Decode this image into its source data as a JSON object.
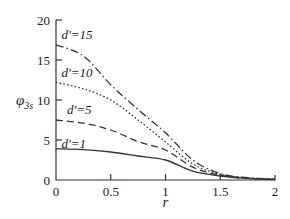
{
  "chart_data": {
    "type": "line",
    "title": "",
    "xlabel": "r",
    "ylabel": "φ3s",
    "ylabel_main": "φ",
    "ylabel_sub": "3s",
    "xlim": [
      0,
      2
    ],
    "ylim": [
      0,
      20
    ],
    "xticks": [
      0,
      0.5,
      1,
      1.5,
      2
    ],
    "xtick_labels": [
      "0",
      "0.5",
      "1",
      "1.5",
      "2"
    ],
    "yticks": [
      0,
      5,
      10,
      15,
      20
    ],
    "ytick_labels": [
      "0",
      "5",
      "10",
      "15",
      "20"
    ],
    "grid": false,
    "legend": "inline labels",
    "series": [
      {
        "name": "d'=15",
        "style": "dash-dot",
        "x": [
          0,
          0.25,
          0.5,
          0.75,
          1.0,
          1.25,
          1.5,
          1.75,
          2.0
        ],
        "values": [
          16.9,
          15.5,
          11.9,
          8.8,
          5.9,
          2.5,
          0.8,
          0.3,
          0.1
        ]
      },
      {
        "name": "d'=10",
        "style": "dotted",
        "x": [
          0,
          0.25,
          0.5,
          0.75,
          1.0,
          1.25,
          1.5,
          1.75,
          2.0
        ],
        "values": [
          12.2,
          11.4,
          10.0,
          7.5,
          4.75,
          2.0,
          0.7,
          0.25,
          0.1
        ]
      },
      {
        "name": "d'=5",
        "style": "dashed",
        "x": [
          0,
          0.25,
          0.5,
          0.75,
          1.0,
          1.25,
          1.5,
          1.75,
          2.0
        ],
        "values": [
          7.5,
          7.1,
          6.25,
          4.8,
          3.75,
          1.6,
          0.6,
          0.2,
          0.1
        ]
      },
      {
        "name": "d'=1",
        "style": "solid",
        "x": [
          0,
          0.25,
          0.5,
          0.75,
          1.0,
          1.25,
          1.5,
          1.75,
          2.0
        ],
        "values": [
          3.9,
          3.8,
          3.5,
          3.0,
          2.5,
          1.1,
          0.5,
          0.2,
          0.05
        ]
      }
    ],
    "annotations": [
      {
        "text": "d'=15",
        "x": 0.05,
        "y": 18.2
      },
      {
        "text": "d'=10",
        "x": 0.05,
        "y": 13.5
      },
      {
        "text": "d'=5",
        "x": 0.1,
        "y": 8.9
      },
      {
        "text": "d'=1",
        "x": 0.05,
        "y": 4.6
      }
    ]
  }
}
